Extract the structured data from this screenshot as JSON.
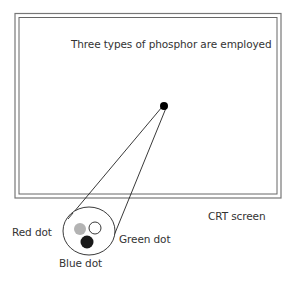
{
  "diagram": {
    "caption": "Three types of phosphor are employed",
    "screen_label": "CRT screen",
    "dots": {
      "red": "Red dot",
      "green": "Green dot",
      "blue": "Blue dot"
    },
    "colors": {
      "frame": "#555555",
      "red_dot": "#b3b3b3",
      "green_dot": "#ffffff",
      "blue_dot": "#1a1a1a",
      "beam_dot": "#000000"
    }
  }
}
